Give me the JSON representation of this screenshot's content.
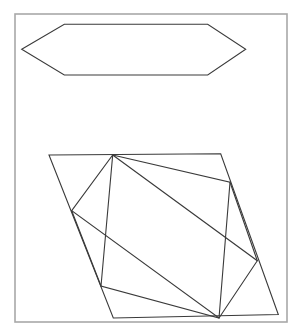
{
  "document": {
    "title": "Geometric line drawing",
    "background_color": "#ffffff",
    "width": 301,
    "height": 336
  },
  "frame": {
    "name": "outer-border",
    "x": 15,
    "y": 14,
    "width": 272,
    "height": 308,
    "stroke_color": "#a8a8a8",
    "stroke_width": 1.6,
    "fill": "none"
  },
  "shapes": [
    {
      "id": "hexagon",
      "label": "Elongated hexagon",
      "type": "polygon",
      "closed": true,
      "stroke_color": "#3a3a3a",
      "stroke_width": 1.1,
      "fill": "none",
      "points": [
        [
          21.7,
          49.3
        ],
        [
          64.3,
          24.3
        ],
        [
          207.7,
          24.3
        ],
        [
          245.7,
          49.3
        ],
        [
          207.7,
          75.0
        ],
        [
          64.3,
          75.0
        ]
      ]
    },
    {
      "id": "outer-parallelogram",
      "label": "Outer parallelogram",
      "type": "polygon",
      "closed": true,
      "stroke_color": "#3a3a3a",
      "stroke_width": 1.1,
      "fill": "none",
      "points": [
        [
          49.0,
          155.0
        ],
        [
          220.7,
          153.8
        ],
        [
          278.3,
          314.5
        ],
        [
          113.3,
          318.0
        ]
      ]
    },
    {
      "id": "inscribed-quad-1",
      "label": "Inscribed quadrilateral one",
      "type": "polygon",
      "closed": true,
      "stroke_color": "#3a3a3a",
      "stroke_width": 1.1,
      "fill": "none",
      "points": [
        [
          112.7,
          155.0
        ],
        [
          257.3,
          260.7
        ],
        [
          219.0,
          318.0
        ],
        [
          71.7,
          210.7
        ]
      ]
    },
    {
      "id": "inscribed-quad-2",
      "label": "Inscribed quadrilateral two",
      "type": "polygon",
      "closed": true,
      "stroke_color": "#3a3a3a",
      "stroke_width": 1.1,
      "fill": "none",
      "points": [
        [
          112.7,
          155.0
        ],
        [
          230.0,
          182.3
        ],
        [
          219.0,
          318.0
        ],
        [
          101.0,
          286.0
        ]
      ]
    },
    {
      "id": "chord-left-bottom",
      "label": "Chord from left vertex to bottom left vertex",
      "type": "polyline",
      "closed": false,
      "stroke_color": "#3a3a3a",
      "stroke_width": 1.1,
      "fill": "none",
      "points": [
        [
          71.7,
          210.7
        ],
        [
          101.0,
          286.0
        ]
      ]
    },
    {
      "id": "chord-right-upper",
      "label": "Chord from right upper vertex to right lower vertex",
      "type": "polyline",
      "closed": false,
      "stroke_color": "#3a3a3a",
      "stroke_width": 1.1,
      "fill": "none",
      "points": [
        [
          230.0,
          182.3
        ],
        [
          257.3,
          260.7
        ]
      ]
    }
  ],
  "vertices": {
    "hexagon": {
      "left_point": [
        21.7,
        49.3
      ],
      "top_left": [
        64.3,
        24.3
      ],
      "top_right": [
        207.7,
        24.3
      ],
      "right_point": [
        245.7,
        49.3
      ],
      "bottom_right": [
        207.7,
        75.0
      ],
      "bottom_left": [
        64.3,
        75.0
      ]
    },
    "parallelogram": {
      "top_left": [
        49.0,
        155.0
      ],
      "top_right": [
        220.7,
        153.8
      ],
      "bottom_right": [
        278.3,
        314.5
      ],
      "bottom_left": [
        113.3,
        318.0
      ]
    },
    "inner": {
      "top": [
        112.7,
        155.0
      ],
      "upper_right": [
        230.0,
        182.3
      ],
      "lower_right": [
        257.3,
        260.7
      ],
      "bottom": [
        219.0,
        318.0
      ],
      "lower_left": [
        101.0,
        286.0
      ],
      "left": [
        71.7,
        210.7
      ]
    }
  }
}
